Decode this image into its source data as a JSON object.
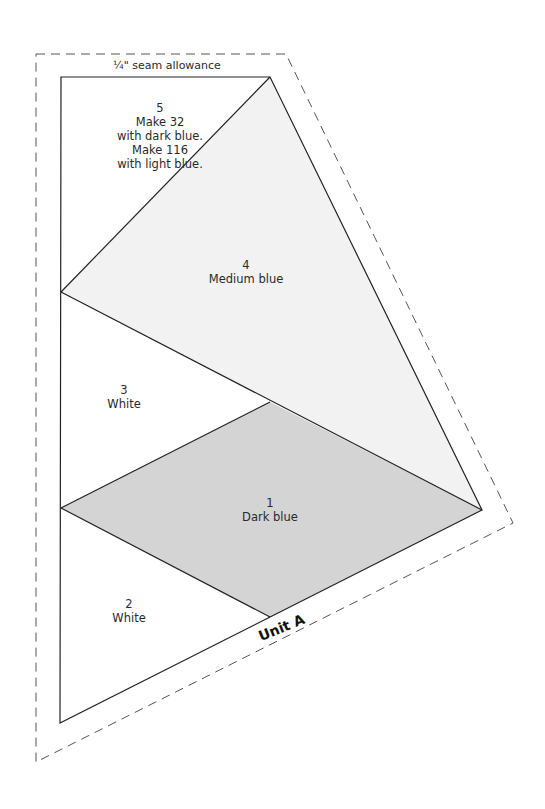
{
  "diagram": {
    "title": "Unit A",
    "seam_label": "¼\" seam allowance",
    "colors": {
      "dark_blue": "#d4d4d4",
      "medium_blue": "#f2f2f2",
      "white": "#ffffff",
      "outline": "#222222",
      "dash": "#555555"
    },
    "pieces": [
      {
        "number": "1",
        "fabric": "Dark blue"
      },
      {
        "number": "2",
        "fabric": "White"
      },
      {
        "number": "3",
        "fabric": "White"
      },
      {
        "number": "4",
        "fabric": "Medium blue"
      },
      {
        "number": "5",
        "lines": [
          "Make 32",
          "with dark blue.",
          "Make 116",
          "with light blue."
        ]
      }
    ]
  }
}
